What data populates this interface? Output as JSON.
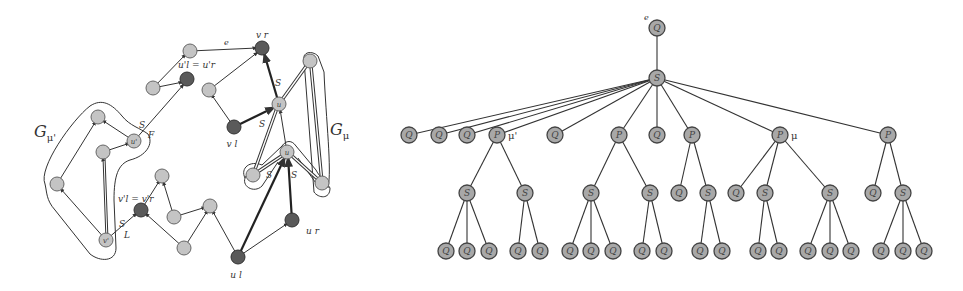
{
  "left_graph": {
    "labels": {
      "G_mu_prime": "G",
      "G_mu_prime_sub": "μ'",
      "G_mu": "G",
      "G_mu_sub": "μ",
      "vr": "v r",
      "vl": "v l",
      "ul": "u l",
      "ur": "u r",
      "u_upper": "u",
      "u_lower": "u",
      "u_prime": "u'",
      "v_prime": "v'",
      "ul_eq_ur_prime": "u'l = u'r",
      "vl_eq_vr_prime": "v'l = v'r",
      "edge_e": "e",
      "S1": "S",
      "S2": "S",
      "S3": "S",
      "S4": "S",
      "S5": "S",
      "S6": "S",
      "F": "F",
      "L": "L"
    }
  },
  "tree": {
    "root_label": "e",
    "mu_prime_label": "μ'",
    "mu_label": "μ",
    "nodes": [
      {
        "id": "root",
        "t": "Q",
        "x": 657,
        "y": 28
      },
      {
        "id": "s0",
        "t": "S",
        "x": 657,
        "y": 78
      },
      {
        "id": "a1",
        "t": "Q",
        "x": 409,
        "y": 135
      },
      {
        "id": "a2",
        "t": "Q",
        "x": 439,
        "y": 135
      },
      {
        "id": "a3",
        "t": "Q",
        "x": 467,
        "y": 135
      },
      {
        "id": "a4",
        "t": "P",
        "x": 497,
        "y": 135
      },
      {
        "id": "a5",
        "t": "Q",
        "x": 555,
        "y": 135
      },
      {
        "id": "a6",
        "t": "P",
        "x": 619,
        "y": 135
      },
      {
        "id": "a7",
        "t": "Q",
        "x": 657,
        "y": 135
      },
      {
        "id": "a8",
        "t": "P",
        "x": 692,
        "y": 135
      },
      {
        "id": "a9",
        "t": "P",
        "x": 780,
        "y": 135
      },
      {
        "id": "a10",
        "t": "P",
        "x": 888,
        "y": 135
      },
      {
        "id": "b1",
        "t": "S",
        "x": 467,
        "y": 193
      },
      {
        "id": "b2",
        "t": "S",
        "x": 525,
        "y": 193
      },
      {
        "id": "b3",
        "t": "S",
        "x": 591,
        "y": 193
      },
      {
        "id": "b4",
        "t": "S",
        "x": 650,
        "y": 193
      },
      {
        "id": "b5",
        "t": "Q",
        "x": 679,
        "y": 193
      },
      {
        "id": "b6",
        "t": "S",
        "x": 708,
        "y": 193
      },
      {
        "id": "b7",
        "t": "Q",
        "x": 736,
        "y": 193
      },
      {
        "id": "b8",
        "t": "S",
        "x": 765,
        "y": 193
      },
      {
        "id": "b9",
        "t": "S",
        "x": 830,
        "y": 193
      },
      {
        "id": "b10",
        "t": "Q",
        "x": 873,
        "y": 193
      },
      {
        "id": "b11",
        "t": "S",
        "x": 903,
        "y": 193
      },
      {
        "id": "c1",
        "t": "Q",
        "x": 446,
        "y": 251
      },
      {
        "id": "c2",
        "t": "Q",
        "x": 467,
        "y": 251
      },
      {
        "id": "c3",
        "t": "Q",
        "x": 489,
        "y": 251
      },
      {
        "id": "c4",
        "t": "Q",
        "x": 518,
        "y": 251
      },
      {
        "id": "c5",
        "t": "Q",
        "x": 540,
        "y": 251
      },
      {
        "id": "c6",
        "t": "Q",
        "x": 570,
        "y": 251
      },
      {
        "id": "c7",
        "t": "Q",
        "x": 591,
        "y": 251
      },
      {
        "id": "c8",
        "t": "Q",
        "x": 613,
        "y": 251
      },
      {
        "id": "c9",
        "t": "Q",
        "x": 642,
        "y": 251
      },
      {
        "id": "c10",
        "t": "Q",
        "x": 664,
        "y": 251
      },
      {
        "id": "c11",
        "t": "Q",
        "x": 700,
        "y": 251
      },
      {
        "id": "c12",
        "t": "Q",
        "x": 722,
        "y": 251
      },
      {
        "id": "c13",
        "t": "Q",
        "x": 758,
        "y": 251
      },
      {
        "id": "c14",
        "t": "Q",
        "x": 779,
        "y": 251
      },
      {
        "id": "c15",
        "t": "Q",
        "x": 808,
        "y": 251
      },
      {
        "id": "c16",
        "t": "Q",
        "x": 830,
        "y": 251
      },
      {
        "id": "c17",
        "t": "Q",
        "x": 851,
        "y": 251
      },
      {
        "id": "c18",
        "t": "Q",
        "x": 881,
        "y": 251
      },
      {
        "id": "c19",
        "t": "Q",
        "x": 903,
        "y": 251
      },
      {
        "id": "c20",
        "t": "Q",
        "x": 924,
        "y": 251
      }
    ],
    "edges": [
      [
        "root",
        "s0"
      ],
      [
        "s0",
        "a1"
      ],
      [
        "s0",
        "a2"
      ],
      [
        "s0",
        "a3"
      ],
      [
        "s0",
        "a4"
      ],
      [
        "s0",
        "a5"
      ],
      [
        "s0",
        "a6"
      ],
      [
        "s0",
        "a7"
      ],
      [
        "s0",
        "a8"
      ],
      [
        "s0",
        "a9"
      ],
      [
        "s0",
        "a10"
      ],
      [
        "a4",
        "b1"
      ],
      [
        "a4",
        "b2"
      ],
      [
        "a6",
        "b3"
      ],
      [
        "a6",
        "b4"
      ],
      [
        "a8",
        "b5"
      ],
      [
        "a8",
        "b6"
      ],
      [
        "a9",
        "b7"
      ],
      [
        "a9",
        "b8"
      ],
      [
        "a9",
        "b9"
      ],
      [
        "a10",
        "b10"
      ],
      [
        "a10",
        "b11"
      ],
      [
        "b1",
        "c1"
      ],
      [
        "b1",
        "c2"
      ],
      [
        "b1",
        "c3"
      ],
      [
        "b2",
        "c4"
      ],
      [
        "b2",
        "c5"
      ],
      [
        "b3",
        "c6"
      ],
      [
        "b3",
        "c7"
      ],
      [
        "b3",
        "c8"
      ],
      [
        "b4",
        "c9"
      ],
      [
        "b4",
        "c10"
      ],
      [
        "b6",
        "c11"
      ],
      [
        "b6",
        "c12"
      ],
      [
        "b8",
        "c13"
      ],
      [
        "b8",
        "c14"
      ],
      [
        "b9",
        "c15"
      ],
      [
        "b9",
        "c16"
      ],
      [
        "b9",
        "c17"
      ],
      [
        "b11",
        "c18"
      ],
      [
        "b11",
        "c19"
      ],
      [
        "b11",
        "c20"
      ]
    ]
  }
}
